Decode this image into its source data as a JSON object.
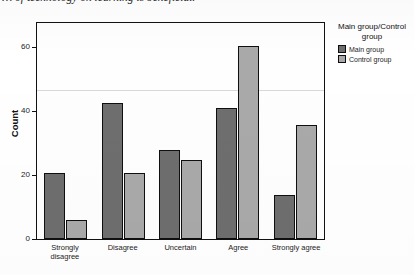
{
  "caption": {
    "text": "… of technology on learning is beneficial."
  },
  "legend": {
    "title": "Main group/Control group",
    "items": [
      {
        "label": "Main group",
        "color": "#6e6e6e"
      },
      {
        "label": "Control group",
        "color": "#a9a9a9"
      }
    ]
  },
  "axes": {
    "y_title": "Count",
    "y_ticks": [
      "0",
      "20",
      "40",
      "60"
    ]
  },
  "chart_data": {
    "type": "bar",
    "title": "",
    "xlabel": "",
    "ylabel": "Count",
    "ylim": [
      0,
      68
    ],
    "grid": false,
    "legend_position": "right",
    "categories": [
      "Strongly disagree",
      "Disagree",
      "Uncertain",
      "Agree",
      "Strongly agree"
    ],
    "series": [
      {
        "name": "Main group",
        "color": "#6e6e6e",
        "values": [
          21,
          43,
          28,
          41.5,
          14
        ]
      },
      {
        "name": "Control group",
        "color": "#a9a9a9",
        "values": [
          6,
          21,
          25,
          61,
          36
        ]
      }
    ],
    "reference_line": 40
  }
}
